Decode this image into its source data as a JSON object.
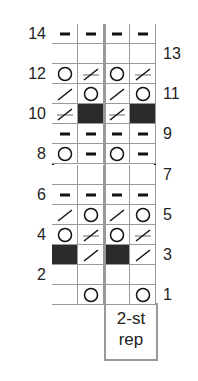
{
  "chart": {
    "columns": 4,
    "rows": 14,
    "repeat_label_line1": "2-st",
    "repeat_label_line2": "rep",
    "row_labels_left": [
      "14",
      "12",
      "10",
      "8",
      "6",
      "4",
      "2"
    ],
    "row_labels_right": [
      "13",
      "11",
      "9",
      "7",
      "5",
      "3",
      "1"
    ],
    "symbol_legend": {
      "purl": "dash",
      "yo": "circle",
      "k2tog": "slash",
      "ssk_ws": "crossed-slash",
      "no_stitch": "dark",
      "knit": "blank"
    },
    "grid": [
      [
        "purl",
        "purl",
        "purl",
        "purl"
      ],
      [
        "knit",
        "knit",
        "knit",
        "knit"
      ],
      [
        "yo",
        "crossed",
        "yo",
        "crossed"
      ],
      [
        "slash",
        "yo",
        "slash",
        "yo"
      ],
      [
        "crossed",
        "dark",
        "crossed",
        "dark"
      ],
      [
        "purl",
        "purl",
        "purl",
        "purl"
      ],
      [
        "yo",
        "purl",
        "yo",
        "purl"
      ],
      [
        "knit",
        "knit",
        "knit",
        "knit"
      ],
      [
        "purl",
        "purl",
        "purl",
        "purl"
      ],
      [
        "slash",
        "yo",
        "slash",
        "yo"
      ],
      [
        "yo",
        "crossed",
        "yo",
        "crossed"
      ],
      [
        "dark",
        "slash",
        "dark",
        "slash"
      ],
      [
        "knit",
        "knit",
        "knit",
        "knit"
      ],
      [
        "knit",
        "yo",
        "knit",
        "yo"
      ]
    ],
    "colors": {
      "border": "#111111",
      "gridline": "#999999",
      "dark_cell": "#2b2b2b",
      "crossbar": "#9a9a9a"
    }
  }
}
